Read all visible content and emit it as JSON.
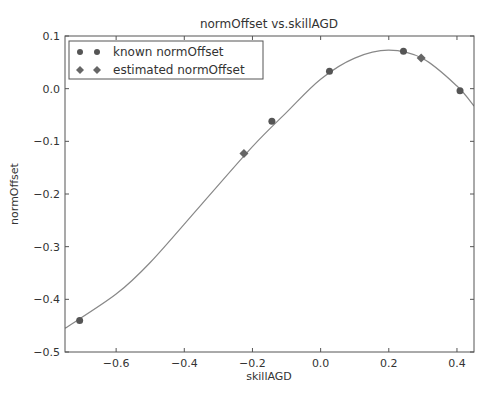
{
  "chart_data": {
    "type": "scatter",
    "title": "normOffset vs.skillAGD",
    "xlabel": "skillAGD",
    "ylabel": "normOffset",
    "xlim": [
      -0.75,
      0.45
    ],
    "ylim": [
      -0.5,
      0.1
    ],
    "xticks": [
      -0.6,
      -0.4,
      -0.2,
      0.0,
      0.2,
      0.4
    ],
    "xtick_labels": [
      "−0.6",
      "−0.4",
      "−0.2",
      "0.0",
      "0.2",
      "0.4"
    ],
    "yticks": [
      0.1,
      0.0,
      -0.1,
      -0.2,
      -0.3,
      -0.4,
      -0.5
    ],
    "ytick_labels": [
      "0.1",
      "0.0",
      "−0.1",
      "−0.2",
      "−0.3",
      "−0.4",
      "−0.5"
    ],
    "grid": false,
    "legend_position": "upper left",
    "series": [
      {
        "name": "known normOffset",
        "marker": "circle",
        "color": "#555555",
        "x": [
          -0.707,
          -0.143,
          0.026,
          0.243,
          0.409
        ],
        "y": [
          -0.44,
          -0.062,
          0.033,
          0.071,
          -0.004
        ]
      },
      {
        "name": "estimated normOffset",
        "marker": "diamond",
        "color": "#666666",
        "x": [
          -0.225,
          0.295
        ],
        "y": [
          -0.123,
          0.058
        ]
      },
      {
        "name": "fit curve",
        "type": "line",
        "color": "#888888",
        "x": [
          -0.75,
          -0.6,
          -0.5,
          -0.35,
          -0.2,
          -0.1,
          0.0,
          0.1,
          0.2,
          0.3,
          0.4,
          0.45
        ],
        "y": [
          -0.455,
          -0.39,
          -0.33,
          -0.22,
          -0.11,
          -0.045,
          0.018,
          0.058,
          0.073,
          0.057,
          0.005,
          -0.033
        ]
      }
    ]
  }
}
